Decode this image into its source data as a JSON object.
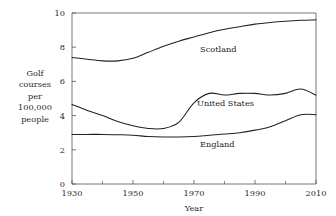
{
  "figure": {
    "background_color": "#ffffff",
    "line_color": "#222222",
    "axis_color": "#555555"
  },
  "ylabel_lines": [
    "Golf",
    "courses",
    "per",
    "100,000",
    "people"
  ],
  "chart_data": {
    "type": "line",
    "title": "",
    "subtitle": "",
    "xlabel": "Year",
    "ylabel": "Golf courses per 100,000 people",
    "xlim": [
      1930,
      2010
    ],
    "ylim": [
      0,
      10
    ],
    "grid": false,
    "legend_position": "inline-curve-labels",
    "xticks": [
      1930,
      1950,
      1970,
      1990,
      2010
    ],
    "xtick_labels": [
      "1930",
      "1950",
      "1970",
      "1990",
      "2010"
    ],
    "xticks_minor": [
      1940,
      1960,
      1980,
      2000
    ],
    "yticks": [
      0,
      2,
      4,
      6,
      8,
      10
    ],
    "ytick_labels": [
      "0",
      "2",
      "4",
      "6",
      "8",
      "10"
    ],
    "x": [
      1930,
      1935,
      1940,
      1945,
      1950,
      1955,
      1960,
      1965,
      1970,
      1975,
      1980,
      1985,
      1990,
      1995,
      2000,
      2005,
      2010
    ],
    "series": [
      {
        "name": "Scotland",
        "label": "Scotland",
        "label_x": 1972,
        "label_y": 7.9,
        "values": [
          7.4,
          7.3,
          7.2,
          7.2,
          7.35,
          7.7,
          8.05,
          8.35,
          8.6,
          8.85,
          9.05,
          9.2,
          9.35,
          9.45,
          9.52,
          9.57,
          9.6
        ]
      },
      {
        "name": "United States",
        "label": "United States",
        "label_x": 1971,
        "label_y": 4.75,
        "values": [
          4.65,
          4.3,
          4.0,
          3.65,
          3.4,
          3.25,
          3.25,
          3.6,
          4.75,
          5.3,
          5.2,
          5.3,
          5.3,
          5.2,
          5.3,
          5.55,
          5.2
        ]
      },
      {
        "name": "England",
        "label": "England",
        "label_x": 1972,
        "label_y": 2.35,
        "values": [
          2.9,
          2.9,
          2.9,
          2.88,
          2.85,
          2.78,
          2.75,
          2.75,
          2.78,
          2.85,
          2.92,
          3.0,
          3.15,
          3.35,
          3.7,
          4.05,
          4.05
        ]
      }
    ]
  }
}
